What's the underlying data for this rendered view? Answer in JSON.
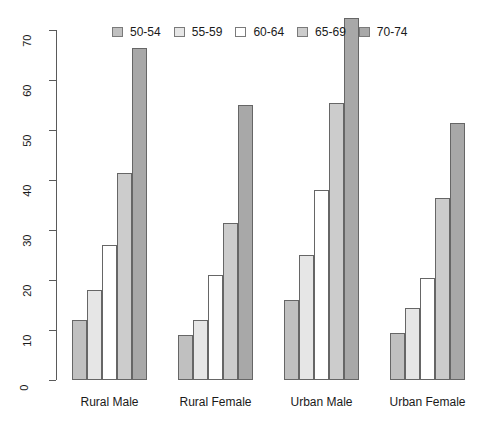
{
  "chart_data": {
    "type": "bar",
    "title": "",
    "subtitle": "",
    "xlabel": "",
    "ylabel": "",
    "categories": [
      "Rural Male",
      "Rural Female",
      "Urban Male",
      "Urban Female"
    ],
    "series": [
      {
        "name": "50-54",
        "color": "#c0c0c0",
        "values": [
          12,
          9,
          16,
          9.5
        ]
      },
      {
        "name": "55-59",
        "color": "#e6e6e6",
        "values": [
          18,
          12,
          25,
          14.5
        ]
      },
      {
        "name": "60-64",
        "color": "#ffffff",
        "values": [
          27,
          21,
          38,
          20.5
        ]
      },
      {
        "name": "65-69",
        "color": "#cccccc",
        "values": [
          41.5,
          31.5,
          55.5,
          36.5
        ]
      },
      {
        "name": "70-74",
        "color": "#a8a8a8",
        "values": [
          66.5,
          55,
          72.5,
          51.5
        ]
      }
    ],
    "ylim": [
      0,
      70
    ],
    "yticks": [
      0,
      10,
      20,
      30,
      40,
      50,
      60,
      70
    ],
    "ytick_labels": [
      "0",
      "10",
      "20",
      "30",
      "40",
      "50",
      "60",
      "70"
    ],
    "grid": false,
    "legend_position": "top-center",
    "legend_entries": [
      "50-54",
      "55-59",
      "60-64",
      "65-69",
      "70-74"
    ],
    "axis_color": "#5a5a5a",
    "bar_border_color": "#666666",
    "background": "#ffffff"
  }
}
